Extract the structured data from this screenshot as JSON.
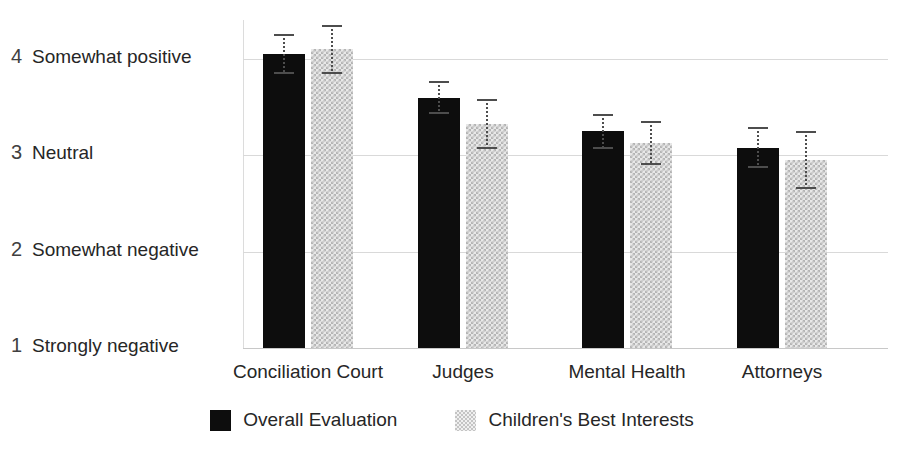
{
  "chart_data": {
    "type": "bar",
    "title": "",
    "subtitle": "",
    "xlabel": "",
    "ylabel": "",
    "categories": [
      "Conciliation Court",
      "Judges",
      "Mental Health",
      "Attorneys"
    ],
    "ylim": [
      1,
      4.3
    ],
    "grid": true,
    "legend_position": "bottom",
    "ytick_values": [
      1,
      2,
      3,
      4
    ],
    "ytick_labels": [
      "Strongly  negative",
      "Somewhat negative",
      "Neutral",
      "Somewhat positive"
    ],
    "series": [
      {
        "name": "Overall Evaluation",
        "color": "#0d0d0d",
        "pattern": "solid",
        "values": [
          4.05,
          3.6,
          3.25,
          3.08
        ],
        "errors": [
          0.21,
          0.17,
          0.18,
          0.21
        ]
      },
      {
        "name": "Children's Best Interests",
        "color": "#d9d9d9",
        "pattern": "checker",
        "values": [
          4.1,
          3.33,
          3.13,
          2.95
        ],
        "errors": [
          0.25,
          0.26,
          0.23,
          0.3
        ]
      }
    ]
  },
  "axis": {
    "y": {
      "ticks": [
        {
          "num": "4",
          "label": "Somewhat positive",
          "value": 4
        },
        {
          "num": "3",
          "label": "Neutral",
          "value": 3
        },
        {
          "num": "2",
          "label": "Somewhat negative",
          "value": 2
        },
        {
          "num": "1",
          "label": "Strongly  negative",
          "value": 1
        }
      ]
    }
  },
  "legend": {
    "items": [
      {
        "label": "Overall Evaluation",
        "style": "series-dark"
      },
      {
        "label": "Children's Best Interests",
        "style": "series-light"
      }
    ]
  }
}
